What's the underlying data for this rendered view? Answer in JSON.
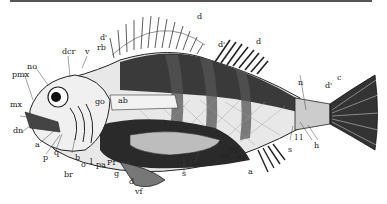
{
  "figure": {
    "colors": {
      "ink": "#1e1e1e",
      "paper": "#ffffff",
      "shade": "#444444"
    }
  },
  "labels": {
    "d_top": "d",
    "d_prime_1": "d'",
    "rb": "rb",
    "dcr": "dcr",
    "v": "v",
    "no": "no",
    "pmx": "pmx",
    "mx": "mx",
    "dn": "dn",
    "go": "go",
    "ab": "ab",
    "d_prime_2": "d'",
    "d_right": "d",
    "n": "n",
    "c": "c",
    "d_prime_3": "d'",
    "ll": "l l",
    "s_tail": "s",
    "h": "h",
    "a_jaw": "a",
    "p": "p",
    "q": "q",
    "b": "b",
    "o": "o",
    "l": "l",
    "pa": "pa",
    "pf": "Pf",
    "br": "br",
    "g": "g",
    "d_vent": "d",
    "vf": "vf",
    "s_mid": "s",
    "ov": "ov",
    "ug": "ug",
    "an": "an",
    "ap": "ap",
    "a_anal": "a"
  }
}
